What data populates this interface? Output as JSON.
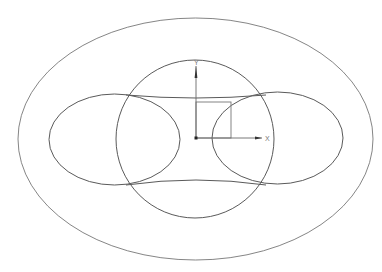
{
  "drawing": {
    "background": "#ffffff",
    "line_color": "#5a5a5a",
    "origin": {
      "x": 196,
      "y": 138
    },
    "outer_ellipse": {
      "cx": 195.5,
      "cy": 139,
      "rx": 177.5,
      "ry": 121
    },
    "center_circle": {
      "cx": 195,
      "cy": 139,
      "r": 79
    },
    "left_ellipse": {
      "cx": 114.5,
      "cy": 139.5,
      "rx": 65.5,
      "ry": 45.5
    },
    "right_ellipse": {
      "cx": 277.5,
      "cy": 138,
      "rx": 65.5,
      "ry": 46
    },
    "top_connector": "M126,95 Q196,101 266,95",
    "bottom_connector": "M126,185 Q196,175 266,185",
    "rectangle": {
      "x": 196,
      "y": 102,
      "width": 35,
      "height": 36
    },
    "axes": {
      "x_label": "X",
      "y_label": "Y",
      "x_end": 262,
      "y_end": 66
    }
  }
}
